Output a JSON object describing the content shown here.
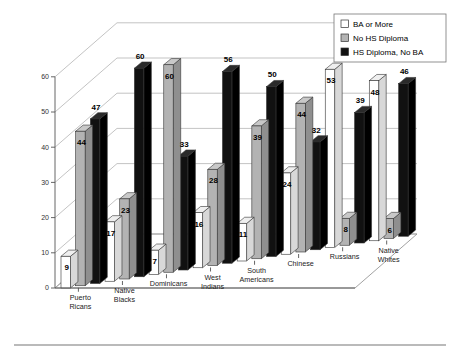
{
  "chart_data": {
    "type": "bar",
    "title": "",
    "subtitle": "",
    "xlabel": "",
    "ylabel": "",
    "ylim": [
      0,
      60
    ],
    "yticks": [
      0,
      10,
      20,
      30,
      40,
      50,
      60
    ],
    "grid": true,
    "legend_position": "top-right",
    "projection": "3d",
    "categories": [
      "Puerto Ricans",
      "Native Blacks",
      "Dominicans",
      "West Indians",
      "South Americans",
      "Chinese",
      "Russians",
      "Native Whites"
    ],
    "series": [
      {
        "name": "BA or More",
        "color": "#ffffff",
        "values": [
          9,
          17,
          7,
          16,
          11,
          24,
          53,
          48
        ]
      },
      {
        "name": "No HS Diploma",
        "color": "#b3b3b3",
        "values": [
          44,
          23,
          60,
          28,
          39,
          44,
          8,
          6
        ]
      },
      {
        "name": "HS Diploma, No BA",
        "color": "#111111",
        "values": [
          47,
          60,
          33,
          56,
          50,
          32,
          39,
          46
        ]
      }
    ]
  },
  "legend": {
    "items": [
      {
        "label": "BA or More",
        "swatch": "#ffffff"
      },
      {
        "label": "No HS Diploma",
        "swatch": "#b3b3b3"
      },
      {
        "label": "HS Diploma, No BA",
        "swatch": "#111111"
      }
    ]
  },
  "axis": {
    "y_ticks": [
      "0",
      "10",
      "20",
      "30",
      "40",
      "50",
      "60"
    ],
    "x_categories": [
      [
        "Puerto",
        "Ricans"
      ],
      [
        "Native",
        "Blacks"
      ],
      [
        "Dominicans",
        ""
      ],
      [
        "West",
        "Indians"
      ],
      [
        "South",
        "Americans"
      ],
      [
        "Chinese",
        ""
      ],
      [
        "Russians",
        ""
      ],
      [
        "Native",
        "Whites"
      ]
    ]
  }
}
